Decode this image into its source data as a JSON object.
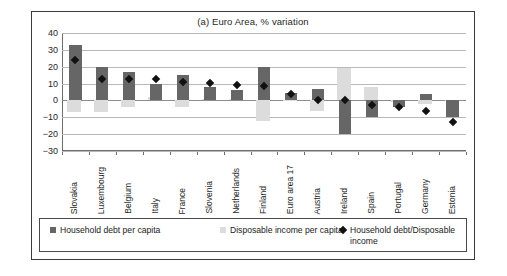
{
  "chart_data": {
    "type": "bar",
    "title": "(a) Euro Area, % variation",
    "xlabel": "",
    "ylabel": "",
    "ylim": [
      -30,
      40
    ],
    "ytick_step": 10,
    "yticks": [
      40,
      30,
      20,
      10,
      0,
      -10,
      -20,
      -30
    ],
    "grid": true,
    "legend_position": "bottom",
    "categories": [
      "Slovakia",
      "Luxembourg",
      "Belgium",
      "Italy",
      "France",
      "Slovenia",
      "Netherlands",
      "Finland",
      "Euro area 17",
      "Austria",
      "Ireland",
      "Spain",
      "Portugal",
      "Germany",
      "Estonia"
    ],
    "series": [
      {
        "name": "Household debt per capita",
        "kind": "bar",
        "color": "#666666",
        "values": [
          33,
          20,
          17,
          10,
          15,
          8,
          6,
          20,
          4.5,
          7,
          -20,
          -10,
          -4,
          4,
          -10
        ]
      },
      {
        "name": "Disposable income per capita",
        "kind": "bar",
        "color": "#dcdcdc",
        "values": [
          -7,
          -7,
          -4,
          2,
          -4,
          1,
          1,
          -12,
          0,
          -6,
          19,
          8,
          -1,
          -2,
          0
        ]
      },
      {
        "name": "Household debt/Disposable income",
        "kind": "marker",
        "color": "#111111",
        "marker": "diamond",
        "values": [
          24,
          13,
          13,
          12.5,
          11,
          10.5,
          9,
          8.5,
          4,
          0.5,
          0,
          -3,
          -4,
          -6,
          -13
        ]
      }
    ]
  },
  "legend": {
    "items": [
      {
        "label": "Household debt per capita",
        "swatch": "swatch-debt",
        "icon": "square-dark-icon"
      },
      {
        "label": "Disposable income per capita",
        "swatch": "swatch-income",
        "icon": "square-light-icon"
      },
      {
        "label": "Household debt/Disposable income",
        "swatch": "swatch-ratio",
        "icon": "diamond-icon"
      }
    ]
  },
  "colors": {
    "debt": "#666666",
    "income": "#dcdcdc",
    "ratio": "#111111",
    "grid": "#b9b9b9",
    "axis": "#6e6e6e",
    "border": "#3a3a3a"
  }
}
